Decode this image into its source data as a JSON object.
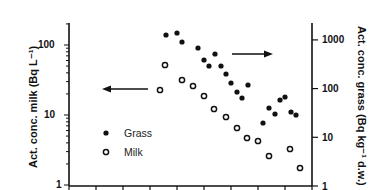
{
  "chart_data": {
    "type": "scatter",
    "title": "",
    "xlabel": "",
    "ylabel_left": "Act. conc. milk (Bq L⁻¹)",
    "ylabel_right": "Act. conc. grass (Bq kg⁻¹ d.w.)",
    "y_left": {
      "scale": "log",
      "range": [
        1,
        200
      ],
      "ticks": [
        "1",
        "10",
        "100"
      ]
    },
    "y_right": {
      "scale": "log",
      "range": [
        1,
        2000
      ],
      "ticks": [
        "1",
        "10",
        "100",
        "1000"
      ]
    },
    "x_ticks_count": 10,
    "grid": false,
    "legend": [
      {
        "label": "Grass",
        "marker": "filled-circle",
        "axis": "right"
      },
      {
        "label": "Milk",
        "marker": "open-circle",
        "axis": "left"
      }
    ],
    "annotations": [
      {
        "type": "arrow",
        "direction": "left",
        "meaning": "milk series uses left axis"
      },
      {
        "type": "arrow",
        "direction": "right",
        "meaning": "grass series uses right axis"
      }
    ],
    "series": [
      {
        "name": "Grass",
        "axis": "right",
        "points_px": [
          [
            166,
            35
          ],
          [
            177,
            33
          ],
          [
            182,
            42
          ],
          [
            198,
            48
          ],
          [
            215,
            54
          ],
          [
            204,
            60
          ],
          [
            209,
            66
          ],
          [
            221,
            66
          ],
          [
            226,
            74
          ],
          [
            231,
            83
          ],
          [
            248,
            85
          ],
          [
            237,
            92
          ],
          [
            242,
            98
          ],
          [
            280,
            100
          ],
          [
            285,
            97
          ],
          [
            269,
            108
          ],
          [
            291,
            112
          ],
          [
            296,
            115
          ],
          [
            275,
            114
          ],
          [
            263,
            123
          ]
        ],
        "values": [
          1200,
          1330,
          870,
          660,
          500,
          380,
          290,
          290,
          200,
          130,
          120,
          85,
          65,
          57,
          63,
          38,
          30,
          26,
          28,
          18
        ]
      },
      {
        "name": "Milk",
        "axis": "left",
        "points_px": [
          [
            165,
            65
          ],
          [
            160,
            90
          ],
          [
            182,
            80
          ],
          [
            193,
            86
          ],
          [
            204,
            96
          ],
          [
            214,
            109
          ],
          [
            226,
            117
          ],
          [
            237,
            128
          ],
          [
            247,
            138
          ],
          [
            258,
            141
          ],
          [
            269,
            156
          ],
          [
            290,
            149
          ],
          [
            300,
            168
          ]
        ],
        "values": [
          52,
          23,
          32,
          26,
          19,
          12,
          9.4,
          6.5,
          4.7,
          4.2,
          2.6,
          3.3,
          1.75
        ]
      }
    ]
  }
}
